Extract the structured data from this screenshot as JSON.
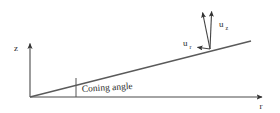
{
  "figure": {
    "title_text": "",
    "background_color": "#ffffff",
    "line_color": "#4a4a4a",
    "text_color": "#2b2b2b",
    "axes": {
      "vertical": {
        "label": "z",
        "label_x": 17,
        "label_y": 50,
        "x": 30,
        "y_top": 42,
        "y_bottom": 97
      },
      "horizontal": {
        "label": "r",
        "label_x": 261,
        "label_y": 108,
        "y": 97,
        "x_left": 30,
        "x_right": 266
      }
    },
    "blade": {
      "name": "coning-blade-line",
      "x1": 30,
      "y1": 97,
      "x2": 251,
      "y2": 41
    },
    "angle_tick": {
      "x": 76,
      "y_top": 78,
      "y_bottom": 97
    },
    "caption": {
      "text": "Coning angle",
      "x": 82,
      "y": 92,
      "rotation": -3.5
    },
    "vectors": [
      {
        "name": "u-z-vector",
        "label": "u",
        "subscript": "z",
        "label_x": 219,
        "label_y": 26,
        "x1": 210,
        "y1": 49,
        "x2": 212,
        "y2": 9
      },
      {
        "name": "u-total-vector",
        "label": "",
        "subscript": "",
        "label_x": 0,
        "label_y": 0,
        "x1": 210,
        "y1": 49,
        "x2": 202,
        "y2": 10
      },
      {
        "name": "u-r-vector",
        "label": "u",
        "subscript": "r",
        "label_x": 184,
        "label_y": 45,
        "x1": 210,
        "y1": 49,
        "x2": 195,
        "y2": 47
      }
    ]
  }
}
